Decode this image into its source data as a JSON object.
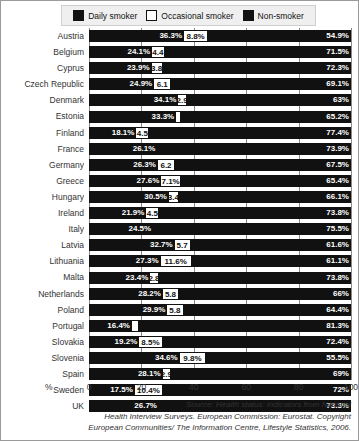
{
  "legend": {
    "items": [
      {
        "label": "Daily smoker",
        "icon": "filled-square-icon",
        "color": "#111111"
      },
      {
        "label": "Occasional smoker",
        "icon": "empty-square-icon",
        "color": "#ffffff"
      },
      {
        "label": "Non-smoker",
        "icon": "filled-square-icon",
        "color": "#111111"
      }
    ]
  },
  "axis": {
    "unit": "%",
    "ticks": [
      "0",
      "20",
      "40",
      "60",
      "80",
      "100"
    ]
  },
  "source": {
    "line1": "Source: Health status: indicators  from National",
    "line2": "Health Interview Surveys. European Commission: Eurostat. Copyright",
    "line3": "European Communities/ The Information Centre, Lifestyle Statistics, 2006."
  },
  "chart_data": {
    "type": "bar",
    "orientation": "horizontal",
    "stacked": true,
    "title": "",
    "xlabel": "%",
    "ylabel": "",
    "xlim": [
      0,
      100
    ],
    "grid": true,
    "legend_position": "top",
    "categories": [
      "Austria",
      "Belgium",
      "Cyprus",
      "Czech Republic",
      "Denmark",
      "Estonia",
      "Finland",
      "France",
      "Germany",
      "Greece",
      "Hungary",
      "Ireland",
      "Italy",
      "Latvia",
      "Lithuania",
      "Malta",
      "Netherlands",
      "Poland",
      "Portugal",
      "Slovakia",
      "Slovenia",
      "Spain",
      "Sweden",
      "UK"
    ],
    "series": [
      {
        "name": "Daily smoker",
        "color": "#111111",
        "values": [
          36.3,
          24.1,
          23.9,
          24.9,
          34.1,
          33.3,
          18.1,
          26.1,
          26.3,
          27.6,
          30.5,
          21.9,
          24.5,
          32.7,
          27.3,
          23.4,
          28.2,
          29.9,
          16.4,
          19.2,
          34.6,
          28.1,
          17.5,
          26.7
        ],
        "labels": [
          "36.3%",
          "24.1%",
          "23.9%",
          "24.9%",
          "34.1%",
          "33.3%",
          "18.1%",
          "26.1%",
          "26.3%",
          "27.6%",
          "30.5%",
          "21.9%",
          "24.5%",
          "32.7%",
          "27.3%",
          "23.4%",
          "28.2%",
          "29.9%",
          "16.4%",
          "19.2%",
          "34.6%",
          "28.1%",
          "17.5%",
          "26.7%"
        ]
      },
      {
        "name": "Occasional smoker",
        "color": "#ffffff",
        "values": [
          8.8,
          4.4,
          3.8,
          6.1,
          2.9,
          1.5,
          4.5,
          0,
          6.2,
          7.1,
          3.4,
          4.5,
          0,
          5.7,
          11.6,
          2.8,
          5.8,
          5.8,
          2.3,
          8.5,
          9.8,
          2.9,
          10.4,
          0
        ],
        "labels": [
          "8.8%",
          "4.4",
          "3.8",
          "6.1",
          "2.9",
          "",
          "4.5",
          "",
          "6.2",
          "7.1%",
          "3.4",
          "4.5",
          "",
          "5.7",
          "11.6%",
          "2.8",
          "5.8",
          "5.8",
          "",
          "8.5%",
          "9.8%",
          "2.9",
          "10.4%",
          ""
        ]
      },
      {
        "name": "Non-smoker",
        "color": "#111111",
        "values": [
          54.9,
          71.5,
          72.3,
          69.1,
          63,
          65.2,
          77.4,
          73.9,
          67.5,
          65.4,
          66.1,
          73.8,
          75.5,
          61.6,
          61.1,
          73.8,
          66,
          64.4,
          81.3,
          72.4,
          55.5,
          69,
          72,
          73.3
        ],
        "labels": [
          "54.9%",
          "71.5%",
          "72.3%",
          "69.1%",
          "63%",
          "65.2%",
          "77.4%",
          "73.9%",
          "67.5%",
          "65.4%",
          "66.1%",
          "73.8%",
          "75.5%",
          "61.6%",
          "61.1%",
          "73.8%",
          "66%",
          "64.4%",
          "81.3%",
          "72.4%",
          "55.5%",
          "69%",
          "72%",
          "73.3%"
        ]
      }
    ]
  }
}
